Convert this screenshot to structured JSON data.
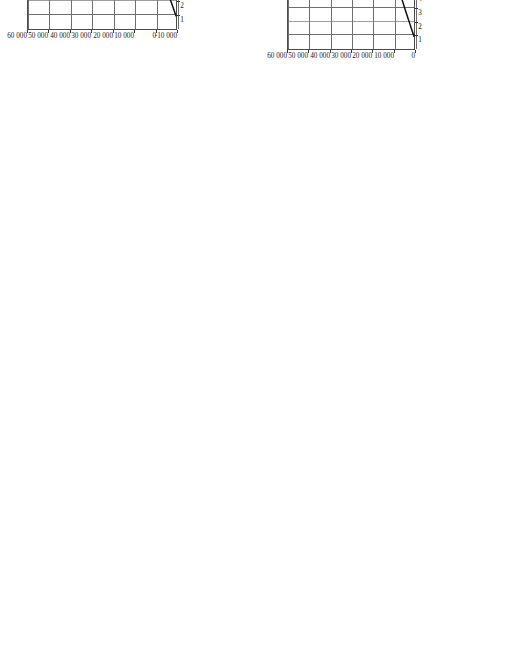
{
  "figure": {
    "orientation": "rotated-90-ccw",
    "background_color": "#ffffff",
    "curve_color": "#111111",
    "grid_color": "#6e6e6e",
    "frame_color": "#4a4a4a"
  },
  "chart_data": [
    {
      "type": "line",
      "panel": "(c)",
      "title": "",
      "xlabel": "功率角θ/(°)",
      "ylabel": "输入功率P₁/W",
      "xlim": [
        0,
        38
      ],
      "ylim": [
        -10000,
        60000
      ],
      "xticks": [
        1,
        2,
        3,
        4,
        5,
        6,
        7,
        8,
        9,
        10,
        11,
        12,
        13,
        14,
        15,
        16,
        17,
        18,
        19,
        20,
        21,
        22,
        23,
        24,
        25,
        26,
        27,
        28,
        29,
        30,
        31,
        32,
        33,
        34,
        35,
        36,
        37
      ],
      "xticklabels": [
        "1",
        "2",
        "3",
        "4",
        "5",
        "6",
        "7",
        "8",
        "9",
        "10",
        "11",
        "12",
        "13",
        "14",
        "15",
        "16",
        "17",
        "18",
        "19",
        "20",
        "21",
        "22",
        "23",
        "24",
        "25",
        "26",
        "27",
        "28",
        "29",
        "30",
        "31",
        "32",
        "33",
        "34",
        "35",
        "36",
        "37"
      ],
      "yticks": [
        -10000,
        0,
        10000,
        20000,
        30000,
        40000,
        50000,
        60000
      ],
      "yticklabels": [
        "-10 000",
        "0",
        "10 000",
        "20 000",
        "30 000",
        "40 000",
        "50 000",
        "60 000"
      ],
      "grid": true,
      "legend": false,
      "series": [
        {
          "name": "输入功率P₁",
          "x": [
            1,
            2,
            3,
            4,
            5,
            6,
            7,
            8,
            9,
            10,
            11,
            12,
            13,
            14,
            15,
            16,
            17,
            18,
            19,
            20,
            21,
            22,
            23,
            24,
            25,
            26,
            27,
            28,
            29,
            30,
            31,
            32,
            33,
            34,
            35,
            36,
            37
          ],
          "values": [
            -9500,
            -7200,
            -4900,
            -2700,
            -700,
            1100,
            2700,
            4200,
            5500,
            6700,
            7800,
            8800,
            9700,
            10600,
            11400,
            12200,
            12950,
            13650,
            14300,
            14900,
            15400,
            15800,
            16100,
            16300,
            16400,
            16350,
            16150,
            15750,
            15100,
            14150,
            12850,
            11150,
            9100,
            6700,
            3900,
            700,
            -2800
          ]
        }
      ]
    },
    {
      "type": "line",
      "panel": "(d)",
      "title": "",
      "xlabel": "功率角θ/(°)",
      "ylabel": "输出功率P₂/W",
      "xlim": [
        0,
        38
      ],
      "ylim": [
        0,
        60000
      ],
      "xticks": [
        1,
        2,
        3,
        4,
        5,
        6,
        7,
        8,
        9,
        10,
        11,
        12,
        13,
        14,
        15,
        16,
        17,
        18,
        19,
        20,
        21,
        22,
        23,
        24,
        25,
        26,
        27,
        28,
        29,
        30,
        31,
        32,
        33,
        34,
        35,
        36,
        37
      ],
      "xticklabels": [
        "1",
        "2",
        "3",
        "4",
        "5",
        "6",
        "7",
        "8",
        "9",
        "10",
        "11",
        "12",
        "13",
        "14",
        "15",
        "16",
        "17",
        "18",
        "19",
        "20",
        "21",
        "22",
        "23",
        "24",
        "25",
        "26",
        "27",
        "28",
        "29",
        "30",
        "31",
        "32",
        "33",
        "34",
        "35",
        "36",
        "37"
      ],
      "yticks": [
        0,
        10000,
        20000,
        30000,
        40000,
        50000,
        60000
      ],
      "yticklabels": [
        "0",
        "10 000",
        "20 000",
        "30 000",
        "40 000",
        "50 000",
        "60 000"
      ],
      "grid": true,
      "legend": false,
      "series": [
        {
          "name": "输出功率P₂",
          "x": [
            1,
            2,
            3,
            4,
            5,
            6,
            7,
            8,
            9,
            10,
            11,
            12,
            13,
            14,
            15,
            16,
            17,
            18,
            19,
            20,
            21,
            22,
            23,
            24,
            25,
            26,
            27,
            28,
            29,
            30,
            31,
            32,
            33,
            34,
            35,
            36,
            37
          ],
          "values": [
            500,
            2600,
            4700,
            6700,
            8600,
            10400,
            12000,
            13500,
            14900,
            16200,
            17400,
            18500,
            19500,
            20450,
            21300,
            22100,
            22850,
            23500,
            24100,
            24650,
            25100,
            25500,
            25800,
            26000,
            26100,
            26050,
            25850,
            25450,
            24800,
            23850,
            22550,
            20850,
            18800,
            16400,
            13600,
            10400,
            6900
          ]
        }
      ]
    }
  ]
}
